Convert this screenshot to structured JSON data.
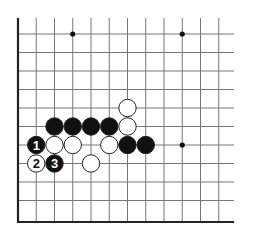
{
  "board": {
    "description": "Go board corner diagram (lower-left corner)",
    "grid": {
      "origin_x": 18,
      "col_spacing": 18.25,
      "first_row_y": 34,
      "row_spacing": 18.5,
      "columns": 12,
      "rows": 11,
      "right_extent": 234,
      "top_extent": 18,
      "bottom_edge_y": 222
    },
    "colors": {
      "line": "#777777",
      "edge": "#222222",
      "black_stone": "#111111",
      "white_stone": "#ffffff",
      "stone_outline": "#222222"
    },
    "hoshi": [
      {
        "col": 3,
        "row": 1
      },
      {
        "col": 9,
        "row": 1
      },
      {
        "col": 9,
        "row": 7
      }
    ],
    "stones": [
      {
        "color": "white",
        "col": 6,
        "row": 5,
        "label": ""
      },
      {
        "color": "black",
        "col": 2,
        "row": 6,
        "label": ""
      },
      {
        "color": "black",
        "col": 3,
        "row": 6,
        "label": ""
      },
      {
        "color": "black",
        "col": 4,
        "row": 6,
        "label": ""
      },
      {
        "color": "black",
        "col": 5,
        "row": 6,
        "label": ""
      },
      {
        "color": "white",
        "col": 6,
        "row": 6,
        "label": ""
      },
      {
        "color": "black",
        "col": 1,
        "row": 7,
        "label": "1"
      },
      {
        "color": "white",
        "col": 2,
        "row": 7,
        "label": ""
      },
      {
        "color": "white",
        "col": 3,
        "row": 7,
        "label": ""
      },
      {
        "color": "white",
        "col": 5,
        "row": 7,
        "label": ""
      },
      {
        "color": "black",
        "col": 6,
        "row": 7,
        "label": ""
      },
      {
        "color": "black",
        "col": 7,
        "row": 7,
        "label": ""
      },
      {
        "color": "white",
        "col": 1,
        "row": 8,
        "label": "2"
      },
      {
        "color": "black",
        "col": 2,
        "row": 8,
        "label": "3"
      },
      {
        "color": "white",
        "col": 4,
        "row": 8,
        "label": ""
      }
    ]
  }
}
